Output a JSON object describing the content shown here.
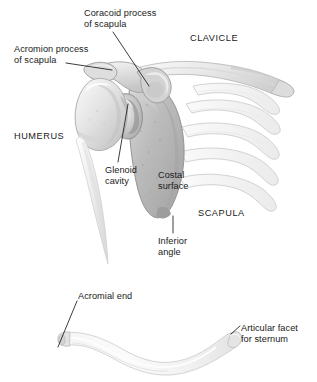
{
  "figure": {
    "background": "#ffffff",
    "text_color": "#1a1a1a",
    "leader_color": "#1a1a1a",
    "bone_light": "#f2f2f2",
    "bone_mid": "#b9b9b9",
    "bone_shade": "#8f8f8f",
    "bone_outline": "#9a9a9a"
  },
  "labels": [
    {
      "name": "coracoid-process",
      "text": "Coracoid process\nof scapula",
      "x": 84,
      "y": 8,
      "align": "left",
      "caps": false
    },
    {
      "name": "acromion-process",
      "text": "Acromion process\nof scapula",
      "x": 14,
      "y": 44,
      "align": "left",
      "caps": false
    },
    {
      "name": "clavicle",
      "text": "CLAVICLE",
      "x": 190,
      "y": 33,
      "align": "left",
      "caps": true
    },
    {
      "name": "humerus",
      "text": "HUMERUS",
      "x": 14,
      "y": 131,
      "align": "left",
      "caps": true
    },
    {
      "name": "glenoid-cavity",
      "text": "Glenoid\ncavity",
      "x": 105,
      "y": 165,
      "align": "left",
      "caps": false
    },
    {
      "name": "costal-surface",
      "text": "Costal\nsurface",
      "x": 158,
      "y": 170,
      "align": "left",
      "caps": false
    },
    {
      "name": "scapula",
      "text": "SCAPULA",
      "x": 198,
      "y": 208,
      "align": "left",
      "caps": true
    },
    {
      "name": "inferior-angle",
      "text": "Inferior\nangle",
      "x": 158,
      "y": 236,
      "align": "left",
      "caps": false
    },
    {
      "name": "acromial-end",
      "text": "Acromial end",
      "x": 78,
      "y": 291,
      "align": "left",
      "caps": false
    },
    {
      "name": "articular-facet-for-sternum",
      "text": "Articular facet\nfor sternum",
      "x": 241,
      "y": 323,
      "align": "left",
      "caps": false
    }
  ],
  "leaders": [
    {
      "name": "leader-coracoid",
      "points": "113,32 149,86"
    },
    {
      "name": "leader-acromion",
      "points": "66,63 112,70"
    },
    {
      "name": "leader-glenoid",
      "points": "128,104 118,162"
    },
    {
      "name": "leader-inferior-angle",
      "points": "173,216 173,233"
    },
    {
      "name": "leader-acromial-end",
      "points": "77,301 58,347"
    },
    {
      "name": "leader-articular-facet",
      "points": "231,334 240,326"
    }
  ],
  "structures": [
    {
      "name": "humerus-bone",
      "label": "Humerus"
    },
    {
      "name": "scapula-bone",
      "label": "Scapula"
    },
    {
      "name": "clavicle-bone",
      "label": "Clavicle"
    },
    {
      "name": "rib-cage",
      "label": "Ribs"
    },
    {
      "name": "clavicle-isolated",
      "label": "Clavicle (isolated, superior view)"
    }
  ]
}
